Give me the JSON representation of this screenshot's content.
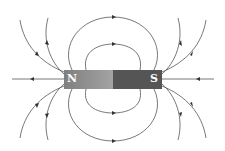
{
  "diagram": {
    "type": "bar-magnet-field-lines",
    "magnet": {
      "north_label": "N",
      "south_label": "S",
      "north_color": "#8f8f8f",
      "south_color": "#555555"
    },
    "line_color": "#444444"
  }
}
